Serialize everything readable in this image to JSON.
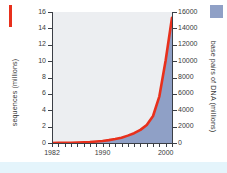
{
  "chart_data": {
    "type": "area",
    "title": "",
    "subtitle": "",
    "xlabel": "",
    "ylabel": "sequences (millions)",
    "y2label": "base pairs of DNA (millions)",
    "grid": false,
    "legend_position": "outside-left-and-right",
    "xlim": [
      1982,
      2001
    ],
    "ylim": [
      0,
      16
    ],
    "y2lim": [
      0,
      16000
    ],
    "x_ticks": [
      1982,
      1983,
      1984,
      1985,
      1986,
      1987,
      1988,
      1989,
      1990,
      1991,
      1992,
      1993,
      1994,
      1995,
      1996,
      1997,
      1998,
      1999,
      2000,
      2001
    ],
    "x_tick_labels": [
      "1982",
      "1990",
      "2000"
    ],
    "x_tick_label_values": [
      1982,
      1990,
      2000
    ],
    "y_tick_labels": [
      "0",
      "2",
      "4",
      "6",
      "8",
      "10",
      "12",
      "14",
      "16"
    ],
    "y_tick_values": [
      0,
      2,
      4,
      6,
      8,
      10,
      12,
      14,
      16
    ],
    "y2_tick_labels": [
      "0",
      "2000",
      "4000",
      "6000",
      "8000",
      "10000",
      "12000",
      "14000",
      "16000"
    ],
    "y2_tick_values": [
      0,
      2000,
      4000,
      6000,
      8000,
      10000,
      12000,
      14000,
      16000
    ],
    "x": [
      1982,
      1983,
      1984,
      1985,
      1986,
      1987,
      1988,
      1989,
      1990,
      1991,
      1992,
      1993,
      1994,
      1995,
      1996,
      1997,
      1998,
      1999,
      2000,
      2001
    ],
    "series": [
      {
        "name": "sequences (millions)",
        "axis": "left",
        "style": "line",
        "color": "#e8301c",
        "values": [
          0.0,
          0.01,
          0.02,
          0.03,
          0.05,
          0.08,
          0.12,
          0.18,
          0.25,
          0.35,
          0.48,
          0.65,
          0.9,
          1.2,
          1.6,
          2.2,
          3.3,
          5.7,
          10.1,
          15.3
        ]
      },
      {
        "name": "base pairs of DNA (millions)",
        "axis": "right",
        "style": "area",
        "color": "#8fa0c6",
        "values": [
          0,
          10,
          20,
          30,
          50,
          80,
          120,
          180,
          250,
          350,
          480,
          650,
          900,
          1200,
          1600,
          2200,
          3300,
          5700,
          10100,
          15300
        ]
      }
    ],
    "colors": {
      "line": "#e8301c",
      "area_fill": "#8fa0c6",
      "plot_background": "#eceef1",
      "axis": "#3b3f46",
      "text": "#3a3a3a",
      "bottom_band": "#e4f4fb"
    }
  },
  "legend": {
    "left_marker_name": "red-line-swatch",
    "right_marker_name": "blue-area-swatch"
  }
}
